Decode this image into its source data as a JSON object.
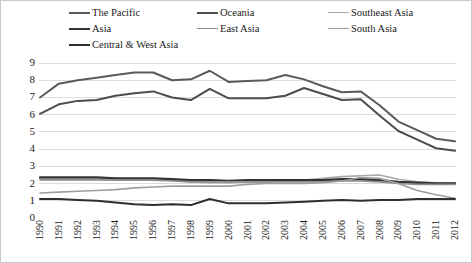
{
  "chart_data": {
    "type": "line",
    "title": "",
    "xlabel": "",
    "ylabel": "",
    "ylim": [
      0,
      9
    ],
    "yticks": [
      0,
      1,
      2,
      3,
      4,
      5,
      6,
      7,
      8,
      9
    ],
    "grid": true,
    "legend_position": "top",
    "categories": [
      "1990",
      "1991",
      "1992",
      "1993",
      "1994",
      "1995",
      "1996",
      "1997",
      "1998",
      "1999",
      "2000",
      "2001",
      "2002",
      "2003",
      "2004",
      "2005",
      "2006",
      "2007",
      "2008",
      "2009",
      "2010",
      "2011",
      "2012"
    ],
    "series": [
      {
        "name": "The Pacific",
        "color": "#5a5a5a",
        "width": 2.0,
        "values": [
          7.0,
          7.8,
          8.0,
          8.15,
          8.3,
          8.45,
          8.45,
          8.0,
          8.05,
          8.55,
          7.9,
          7.95,
          8.0,
          8.3,
          8.05,
          7.65,
          7.3,
          7.35,
          6.55,
          5.6,
          5.1,
          4.6,
          4.45
        ]
      },
      {
        "name": "Oceania",
        "color": "#4d4d4d",
        "width": 2.0,
        "values": [
          6.05,
          6.6,
          6.8,
          6.85,
          7.1,
          7.25,
          7.35,
          7.0,
          6.85,
          7.5,
          6.95,
          6.95,
          6.95,
          7.1,
          7.55,
          7.2,
          6.85,
          6.9,
          5.95,
          5.05,
          4.55,
          4.05,
          3.9
        ]
      },
      {
        "name": "Southeast Asia",
        "color": "#a8a8a8",
        "width": 1.6,
        "values": [
          2.2,
          2.2,
          2.2,
          2.2,
          2.2,
          2.2,
          2.2,
          2.2,
          2.1,
          2.05,
          2.05,
          2.1,
          2.1,
          2.15,
          2.2,
          2.3,
          2.4,
          2.45,
          2.5,
          2.25,
          2.1,
          2.05,
          2.05
        ]
      },
      {
        "name": "Asia",
        "color": "#333333",
        "width": 2.4,
        "values": [
          2.35,
          2.35,
          2.35,
          2.35,
          2.3,
          2.3,
          2.3,
          2.25,
          2.2,
          2.2,
          2.15,
          2.2,
          2.2,
          2.2,
          2.2,
          2.2,
          2.25,
          2.25,
          2.2,
          2.1,
          2.05,
          2.0,
          2.0
        ]
      },
      {
        "name": "East Asia",
        "color": "#8f8f8f",
        "width": 1.6,
        "values": [
          2.25,
          2.25,
          2.25,
          2.25,
          2.2,
          2.2,
          2.2,
          2.15,
          2.1,
          2.1,
          2.1,
          2.1,
          2.1,
          2.1,
          2.1,
          2.1,
          2.15,
          2.15,
          2.1,
          2.0,
          1.95,
          1.95,
          1.95
        ]
      },
      {
        "name": "South Asia",
        "color": "#9e9e9e",
        "width": 1.6,
        "values": [
          1.45,
          1.5,
          1.55,
          1.6,
          1.65,
          1.75,
          1.8,
          1.85,
          1.85,
          1.85,
          1.85,
          1.95,
          2.0,
          2.0,
          2.0,
          2.05,
          2.15,
          2.35,
          2.3,
          2.0,
          1.6,
          1.35,
          1.15
        ]
      },
      {
        "name": "Central & West Asia",
        "color": "#2e2e2e",
        "width": 2.0,
        "values": [
          1.1,
          1.1,
          1.05,
          1.0,
          0.9,
          0.8,
          0.75,
          0.8,
          0.75,
          1.1,
          0.85,
          0.85,
          0.85,
          0.9,
          0.95,
          1.0,
          1.05,
          1.0,
          1.05,
          1.05,
          1.1,
          1.1,
          1.1
        ]
      }
    ]
  },
  "legend": {
    "items": [
      {
        "label": "The Pacific",
        "color": "#5a5a5a",
        "width": 2.0,
        "col": 0,
        "row": 0
      },
      {
        "label": "Oceania",
        "color": "#4d4d4d",
        "width": 2.0,
        "col": 1,
        "row": 0
      },
      {
        "label": "Southeast Asia",
        "color": "#a8a8a8",
        "width": 1.6,
        "col": 2,
        "row": 0
      },
      {
        "label": "Asia",
        "color": "#333333",
        "width": 2.8,
        "col": 0,
        "row": 1
      },
      {
        "label": "East Asia",
        "color": "#8f8f8f",
        "width": 1.6,
        "col": 1,
        "row": 1
      },
      {
        "label": "South Asia",
        "color": "#9e9e9e",
        "width": 1.6,
        "col": 2,
        "row": 1
      },
      {
        "label": "Central & West Asia",
        "color": "#2e2e2e",
        "width": 2.2,
        "col": 0,
        "row": 2
      }
    ]
  },
  "colors": {
    "grid": "#dcdcdc",
    "axis": "#c9c9c9",
    "border": "#c9c9c9",
    "text": "#1a1a1a",
    "background": "#ffffff"
  }
}
